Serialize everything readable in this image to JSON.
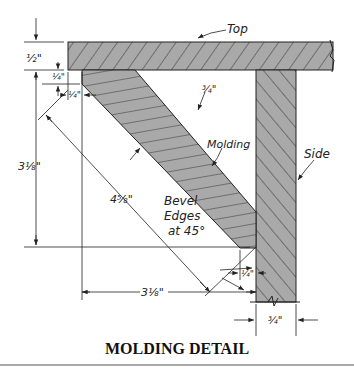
{
  "diagram": {
    "title": "MOLDING DETAIL",
    "parts": {
      "top": "Top",
      "side": "Side",
      "molding": "Molding"
    },
    "notes": {
      "bevel_line1": "Bevel",
      "bevel_line2": "Edges",
      "bevel_line3": "at 45°"
    },
    "dimensions": {
      "top_thickness": "½\"",
      "inset_vertical": "¼\"",
      "inset_horizontal": "¼\"",
      "molding_thickness": "¾\"",
      "vertical_height": "3⅛\"",
      "diagonal_length": "4⅝\"",
      "horizontal_width": "3⅛\"",
      "side_inset": "¼\"",
      "side_thickness": "¾\""
    },
    "colors": {
      "wood_fill": "#a9a9a9",
      "line": "#222222",
      "hatch": "#333333"
    }
  }
}
